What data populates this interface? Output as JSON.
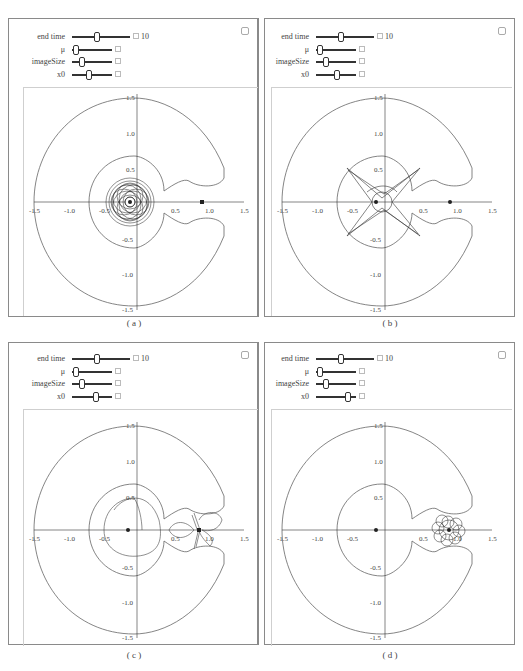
{
  "panels": [
    {
      "id": "a",
      "caption": "( a )",
      "controls": {
        "end_time": {
          "label": "end time",
          "value": "10",
          "thumb_pos": 0.4
        },
        "mu": {
          "label": "μ",
          "thumb_pos": 0.05
        },
        "image_size": {
          "label": "imageSize",
          "thumb_pos": 0.2
        },
        "x0": {
          "label": "x0",
          "thumb_pos": 0.4
        }
      }
    },
    {
      "id": "b",
      "caption": "( b )",
      "controls": {
        "end_time": {
          "label": "end time",
          "value": "10",
          "thumb_pos": 0.4
        },
        "mu": {
          "label": "μ",
          "thumb_pos": 0.05
        },
        "image_size": {
          "label": "imageSize",
          "thumb_pos": 0.2
        },
        "x0": {
          "label": "x0",
          "thumb_pos": 0.5
        }
      }
    },
    {
      "id": "c",
      "caption": "( c )",
      "controls": {
        "end_time": {
          "label": "end time",
          "value": "10",
          "thumb_pos": 0.4
        },
        "mu": {
          "label": "μ",
          "thumb_pos": 0.05
        },
        "image_size": {
          "label": "imageSize",
          "thumb_pos": 0.2
        },
        "x0": {
          "label": "x0",
          "thumb_pos": 0.55
        }
      }
    },
    {
      "id": "d",
      "caption": "( d )",
      "controls": {
        "end_time": {
          "label": "end time",
          "value": "10",
          "thumb_pos": 0.4
        },
        "mu": {
          "label": "μ",
          "thumb_pos": 0.05
        },
        "image_size": {
          "label": "imageSize",
          "thumb_pos": 0.2
        },
        "x0": {
          "label": "x0",
          "thumb_pos": 0.75
        }
      }
    }
  ],
  "axes": {
    "x_ticks": [
      "-1.5",
      "-1.0",
      "-0.5",
      "0.5",
      "1.0",
      "1.5"
    ],
    "y_ticks": [
      "1.5",
      "1.0",
      "0.5",
      "-0.5",
      "-1.0",
      "-1.5"
    ],
    "range": [
      -1.5,
      1.5
    ]
  },
  "colors": {
    "curve": "#666666",
    "trajectory": "#333333",
    "axis": "#333333",
    "frame": "#8a8a8a"
  }
}
